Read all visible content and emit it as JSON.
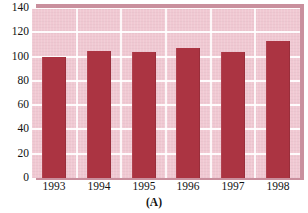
{
  "chart_data": {
    "type": "bar",
    "title": "",
    "subtitle": "",
    "caption": "(A)",
    "xlabel": "",
    "ylabel": "",
    "categories": [
      "1993",
      "1994",
      "1995",
      "1996",
      "1997",
      "1998"
    ],
    "values": [
      100,
      105,
      104,
      107,
      104,
      113
    ],
    "series": [
      {
        "name": "",
        "values": [
          100,
          105,
          104,
          107,
          104,
          113
        ]
      }
    ],
    "ylim": [
      0,
      140
    ],
    "yticks": [
      0,
      20,
      40,
      60,
      80,
      100,
      120,
      140
    ],
    "ytick_labels": [
      "0",
      "20",
      "40",
      "60",
      "80",
      "100",
      "120",
      "140"
    ],
    "grid": true,
    "grid_axis": "both",
    "legend": false,
    "legend_position": "none",
    "bar_color": "#ab3442",
    "plot_background": "#f0c8d2",
    "gridline_color": "#ffffff",
    "panel_shadow_color": "#c98f9d",
    "text_color": "#121212",
    "figure_background": "#ffffff",
    "annotations": []
  },
  "axis": {
    "y_labels": [
      "140",
      "120",
      "100",
      "80",
      "60",
      "40",
      "20",
      "0"
    ],
    "x_labels": [
      "1993",
      "1994",
      "1995",
      "1996",
      "1997",
      "1998"
    ]
  },
  "caption": {
    "text": "(A)"
  }
}
